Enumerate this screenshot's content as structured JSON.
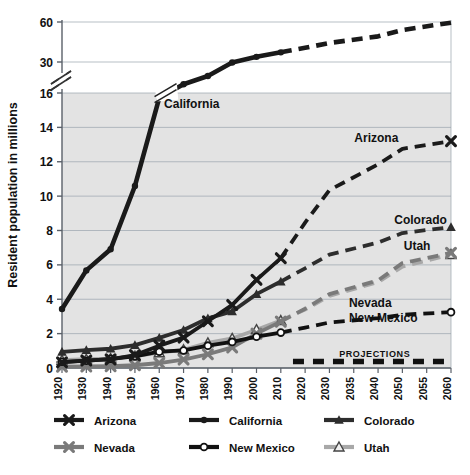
{
  "chart_data": {
    "type": "line",
    "title": "",
    "xlabel": "",
    "ylabel": "Resident population in millions",
    "x": [
      1920,
      1930,
      1940,
      1950,
      1960,
      1970,
      1980,
      1990,
      2000,
      2010,
      2020,
      2030,
      2035,
      2040,
      2050,
      2055,
      2060
    ],
    "xticklabels": [
      "1920",
      "1930",
      "1940",
      "1950",
      "1960",
      "1970",
      "1980",
      "1990",
      "2000",
      "2010",
      "2020",
      "2030",
      "2035",
      "2040",
      "2050",
      "2055",
      "2060"
    ],
    "yticklabels": [
      "0",
      "2",
      "4",
      "6",
      "8",
      "10",
      "12",
      "14",
      "16",
      "30",
      "60"
    ],
    "ytickvalues": [
      0,
      2,
      4,
      6,
      8,
      10,
      12,
      14,
      16,
      30,
      60
    ],
    "ylim": [
      0,
      60
    ],
    "axis_break": {
      "below": 16,
      "above": 30,
      "note": "broken y-axis between 16 and 30"
    },
    "grid": true,
    "legend_position": "bottom",
    "shaded_band": {
      "from": 0,
      "to": 16,
      "color": "#e3e3e3"
    },
    "projection_marker_label": "PROJECTIONS",
    "projection_start_year": 2015,
    "series": [
      {
        "name": "Arizona",
        "marker": "x",
        "color": "#1a1a1a",
        "label_text": "Arizona",
        "historical": [
          {
            "x": 1920,
            "y": 0.33
          },
          {
            "x": 1930,
            "y": 0.44
          },
          {
            "x": 1940,
            "y": 0.5
          },
          {
            "x": 1950,
            "y": 0.75
          },
          {
            "x": 1960,
            "y": 1.3
          },
          {
            "x": 1970,
            "y": 1.77
          },
          {
            "x": 1980,
            "y": 2.72
          },
          {
            "x": 1990,
            "y": 3.67
          },
          {
            "x": 2000,
            "y": 5.13
          },
          {
            "x": 2010,
            "y": 6.39
          }
        ],
        "projected": [
          {
            "x": 2010,
            "y": 6.39
          },
          {
            "x": 2020,
            "y": 8.46
          },
          {
            "x": 2030,
            "y": 10.35
          },
          {
            "x": 2040,
            "y": 11.85
          },
          {
            "x": 2050,
            "y": 12.75
          },
          {
            "x": 2060,
            "y": 13.2
          }
        ]
      },
      {
        "name": "California",
        "marker": "circle-filled",
        "color": "#1a1a1a",
        "label_text": "California",
        "historical": [
          {
            "x": 1920,
            "y": 3.43
          },
          {
            "x": 1930,
            "y": 5.68
          },
          {
            "x": 1940,
            "y": 6.91
          },
          {
            "x": 1950,
            "y": 10.59
          },
          {
            "x": 1960,
            "y": 15.72
          },
          {
            "x": 1970,
            "y": 19.97
          },
          {
            "x": 1980,
            "y": 23.67
          },
          {
            "x": 1990,
            "y": 29.76
          },
          {
            "x": 2000,
            "y": 33.87
          },
          {
            "x": 2010,
            "y": 37.25
          }
        ],
        "projected": [
          {
            "x": 2010,
            "y": 37.25
          },
          {
            "x": 2020,
            "y": 40.62
          },
          {
            "x": 2030,
            "y": 44.28
          },
          {
            "x": 2040,
            "y": 49.24
          },
          {
            "x": 2050,
            "y": 54.0
          },
          {
            "x": 2060,
            "y": 59.5
          }
        ]
      },
      {
        "name": "Colorado",
        "marker": "triangle-filled",
        "color": "#2d2d2d",
        "label_text": "Colorado",
        "historical": [
          {
            "x": 1920,
            "y": 0.94
          },
          {
            "x": 1930,
            "y": 1.04
          },
          {
            "x": 1940,
            "y": 1.12
          },
          {
            "x": 1950,
            "y": 1.33
          },
          {
            "x": 1960,
            "y": 1.75
          },
          {
            "x": 1970,
            "y": 2.21
          },
          {
            "x": 1980,
            "y": 2.89
          },
          {
            "x": 1990,
            "y": 3.29
          },
          {
            "x": 2000,
            "y": 4.3
          },
          {
            "x": 2010,
            "y": 5.03
          }
        ],
        "projected": [
          {
            "x": 2010,
            "y": 5.03
          },
          {
            "x": 2020,
            "y": 5.8
          },
          {
            "x": 2030,
            "y": 6.6
          },
          {
            "x": 2040,
            "y": 7.3
          },
          {
            "x": 2050,
            "y": 7.85
          },
          {
            "x": 2060,
            "y": 8.2
          }
        ]
      },
      {
        "name": "Nevada",
        "marker": "x",
        "color": "#7a7a7a",
        "label_text": "Nevada",
        "historical": [
          {
            "x": 1920,
            "y": 0.08
          },
          {
            "x": 1930,
            "y": 0.09
          },
          {
            "x": 1940,
            "y": 0.11
          },
          {
            "x": 1950,
            "y": 0.16
          },
          {
            "x": 1960,
            "y": 0.29
          },
          {
            "x": 1970,
            "y": 0.49
          },
          {
            "x": 1980,
            "y": 0.8
          },
          {
            "x": 1990,
            "y": 1.2
          },
          {
            "x": 2000,
            "y": 2.0
          },
          {
            "x": 2010,
            "y": 2.7
          }
        ],
        "projected": [
          {
            "x": 2010,
            "y": 2.7
          },
          {
            "x": 2020,
            "y": 3.45
          },
          {
            "x": 2030,
            "y": 4.3
          },
          {
            "x": 2040,
            "y": 5.1
          },
          {
            "x": 2050,
            "y": 6.1
          },
          {
            "x": 2060,
            "y": 6.7
          }
        ]
      },
      {
        "name": "New Mexico",
        "marker": "circle-open",
        "color": "#111111",
        "label_text": "New Mexico",
        "historical": [
          {
            "x": 1920,
            "y": 0.36
          },
          {
            "x": 1930,
            "y": 0.42
          },
          {
            "x": 1940,
            "y": 0.53
          },
          {
            "x": 1950,
            "y": 0.68
          },
          {
            "x": 1960,
            "y": 0.95
          },
          {
            "x": 1970,
            "y": 1.02
          },
          {
            "x": 1980,
            "y": 1.3
          },
          {
            "x": 1990,
            "y": 1.52
          },
          {
            "x": 2000,
            "y": 1.82
          },
          {
            "x": 2010,
            "y": 2.06
          }
        ],
        "projected": [
          {
            "x": 2010,
            "y": 2.06
          },
          {
            "x": 2020,
            "y": 2.35
          },
          {
            "x": 2030,
            "y": 2.65
          },
          {
            "x": 2040,
            "y": 2.9
          },
          {
            "x": 2050,
            "y": 3.1
          },
          {
            "x": 2060,
            "y": 3.25
          }
        ]
      },
      {
        "name": "Utah",
        "marker": "triangle-open",
        "color": "#a8a8a8",
        "label_text": "Utah",
        "historical": [
          {
            "x": 1920,
            "y": 0.45
          },
          {
            "x": 1930,
            "y": 0.51
          },
          {
            "x": 1940,
            "y": 0.55
          },
          {
            "x": 1950,
            "y": 0.69
          },
          {
            "x": 1960,
            "y": 0.89
          },
          {
            "x": 1970,
            "y": 1.06
          },
          {
            "x": 1980,
            "y": 1.46
          },
          {
            "x": 1990,
            "y": 1.72
          },
          {
            "x": 2000,
            "y": 2.23
          },
          {
            "x": 2010,
            "y": 2.76
          }
        ],
        "projected": [
          {
            "x": 2010,
            "y": 2.76
          },
          {
            "x": 2020,
            "y": 3.4
          },
          {
            "x": 2030,
            "y": 4.2
          },
          {
            "x": 2040,
            "y": 5.0
          },
          {
            "x": 2050,
            "y": 5.9
          },
          {
            "x": 2060,
            "y": 6.6
          }
        ]
      }
    ],
    "annotations": [
      {
        "text": "California",
        "x": 1962,
        "y": 15.1
      },
      {
        "text": "Arizona",
        "x": 2041,
        "y": 13.15
      },
      {
        "text": "Colorado",
        "x": 2047,
        "y": 8.35
      },
      {
        "text": "Utah",
        "x": 2049,
        "y": 6.85
      },
      {
        "text": "Nevada",
        "x": 2034,
        "y": 3.55
      },
      {
        "text": "New Mexico",
        "x": 2034,
        "y": 2.65
      },
      {
        "text": "PROJECTIONS",
        "x": 2038,
        "y": 0.62
      }
    ]
  },
  "legend": {
    "items": [
      {
        "label": "Arizona",
        "marker": "x",
        "color": "#1a1a1a"
      },
      {
        "label": "California",
        "marker": "circle-filled",
        "color": "#1a1a1a"
      },
      {
        "label": "Colorado",
        "marker": "triangle-filled",
        "color": "#2d2d2d"
      },
      {
        "label": "Nevada",
        "marker": "x",
        "color": "#7a7a7a"
      },
      {
        "label": "New Mexico",
        "marker": "circle-open",
        "color": "#111111"
      },
      {
        "label": "Utah",
        "marker": "triangle-open",
        "color": "#a8a8a8"
      }
    ]
  }
}
